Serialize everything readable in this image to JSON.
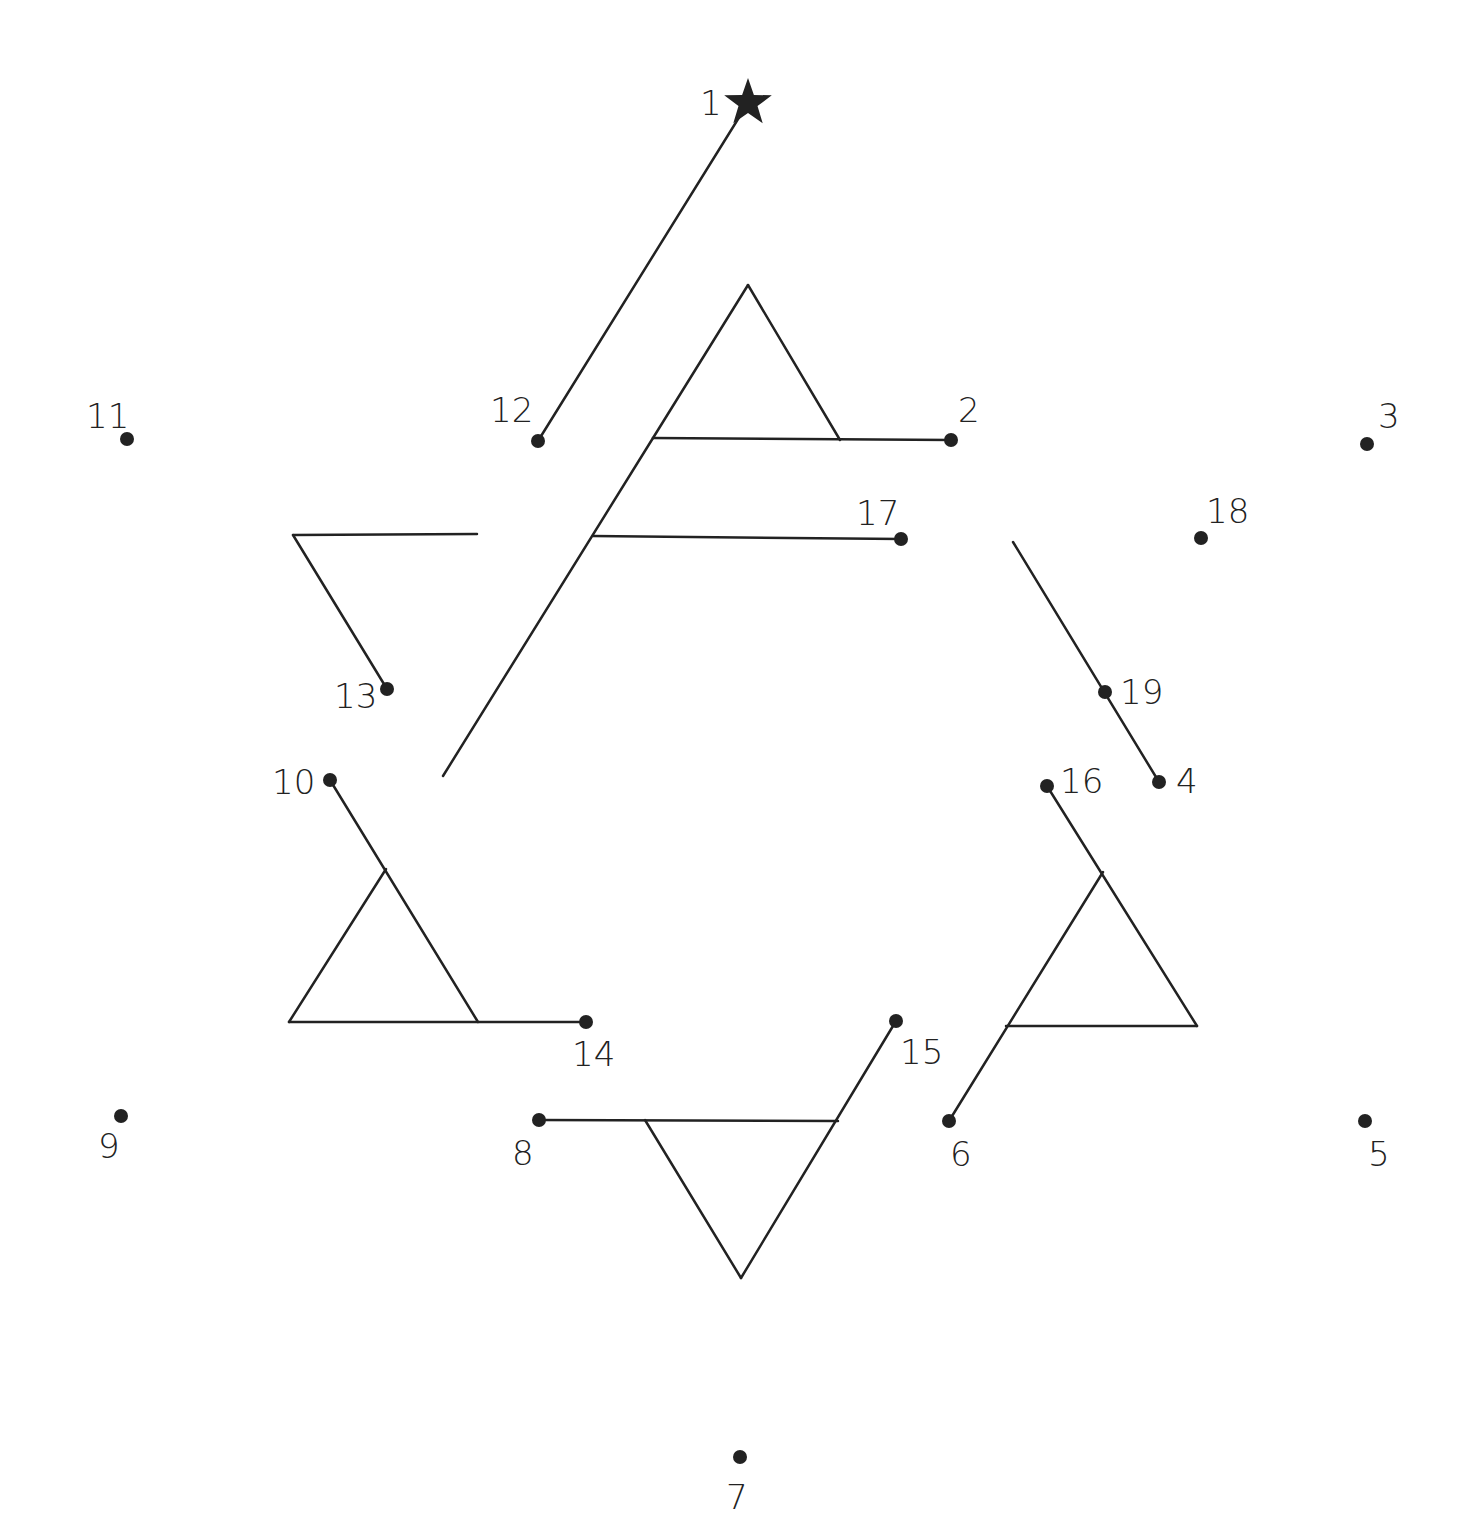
{
  "puzzle": {
    "type": "connect-the-dots",
    "line_color": "#222222",
    "start_marker": "star-icon",
    "dots": [
      {
        "n": "1",
        "x": 748,
        "y": 103,
        "lx": 700,
        "ly": 115,
        "star": true
      },
      {
        "n": "2",
        "x": 951,
        "y": 440,
        "lx": 958,
        "ly": 422
      },
      {
        "n": "3",
        "x": 1367,
        "y": 444,
        "lx": 1378,
        "ly": 428
      },
      {
        "n": "4",
        "x": 1159,
        "y": 782,
        "lx": 1176,
        "ly": 793
      },
      {
        "n": "5",
        "x": 1365,
        "y": 1121,
        "lx": 1368,
        "ly": 1166
      },
      {
        "n": "6",
        "x": 949,
        "y": 1121,
        "lx": 950,
        "ly": 1166
      },
      {
        "n": "7",
        "x": 740,
        "y": 1457,
        "lx": 726,
        "ly": 1509
      },
      {
        "n": "8",
        "x": 539,
        "y": 1120,
        "lx": 512,
        "ly": 1165
      },
      {
        "n": "9",
        "x": 121,
        "y": 1116,
        "lx": 98,
        "ly": 1158
      },
      {
        "n": "10",
        "x": 330,
        "y": 780,
        "lx": 272,
        "ly": 794
      },
      {
        "n": "11",
        "x": 127,
        "y": 439,
        "lx": 86,
        "ly": 428
      },
      {
        "n": "12",
        "x": 538,
        "y": 441,
        "lx": 490,
        "ly": 422
      },
      {
        "n": "13",
        "x": 387,
        "y": 689,
        "lx": 334,
        "ly": 708
      },
      {
        "n": "14",
        "x": 586,
        "y": 1022,
        "lx": 572,
        "ly": 1066
      },
      {
        "n": "15",
        "x": 896,
        "y": 1021,
        "lx": 900,
        "ly": 1064
      },
      {
        "n": "16",
        "x": 1047,
        "y": 786,
        "lx": 1060,
        "ly": 793
      },
      {
        "n": "17",
        "x": 901,
        "y": 539,
        "lx": 856,
        "ly": 525
      },
      {
        "n": "18",
        "x": 1201,
        "y": 538,
        "lx": 1206,
        "ly": 523
      },
      {
        "n": "19",
        "x": 1105,
        "y": 692,
        "lx": 1120,
        "ly": 704
      }
    ],
    "segments": [
      [
        [
          748,
          103
        ],
        [
          538,
          441
        ]
      ],
      [
        [
          748,
          285
        ],
        [
          653,
          438
        ]
      ],
      [
        [
          748,
          285
        ],
        [
          840,
          440
        ]
      ],
      [
        [
          653,
          438
        ],
        [
          951,
          440
        ]
      ],
      [
        [
          653,
          438
        ],
        [
          443,
          776
        ]
      ],
      [
        [
          593,
          536
        ],
        [
          901,
          539
        ]
      ],
      [
        [
          293,
          535
        ],
        [
          477,
          534
        ]
      ],
      [
        [
          293,
          535
        ],
        [
          387,
          689
        ]
      ],
      [
        [
          1013,
          542
        ],
        [
          1159,
          782
        ]
      ],
      [
        [
          330,
          780
        ],
        [
          478,
          1022
        ]
      ],
      [
        [
          386,
          869
        ],
        [
          289,
          1022
        ]
      ],
      [
        [
          289,
          1022
        ],
        [
          586,
          1022
        ]
      ],
      [
        [
          539,
          1120
        ],
        [
          838,
          1121
        ]
      ],
      [
        [
          645,
          1120
        ],
        [
          741,
          1278
        ]
      ],
      [
        [
          896,
          1021
        ],
        [
          741,
          1278
        ]
      ],
      [
        [
          1047,
          786
        ],
        [
          1197,
          1026
        ]
      ],
      [
        [
          1103,
          872
        ],
        [
          949,
          1121
        ]
      ],
      [
        [
          1006,
          1026
        ],
        [
          1197,
          1026
        ]
      ]
    ]
  }
}
